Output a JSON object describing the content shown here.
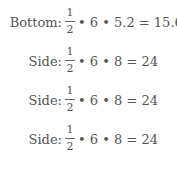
{
  "rows": [
    {
      "label": "Bottom:",
      "numerator": "1",
      "denominator": "2",
      "expression": "• 6 • 5.2 = 15.6"
    },
    {
      "label": "Side:",
      "numerator": "1",
      "denominator": "2",
      "expression": "• 6 • 8 = 24"
    },
    {
      "label": "Side:",
      "numerator": "1",
      "denominator": "2",
      "expression": "• 6 • 8 = 24"
    },
    {
      "label": "Side:",
      "numerator": "1",
      "denominator": "2",
      "expression": "• 6 • 8 = 24"
    }
  ]
}
